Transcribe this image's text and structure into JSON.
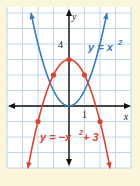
{
  "chart_data": {
    "type": "line",
    "title": "",
    "xlabel": "x",
    "ylabel": "y",
    "xlim": [
      -4,
      4
    ],
    "ylim": [
      -4,
      6.4
    ],
    "grid": true,
    "tick_labels": {
      "x": [
        "1"
      ],
      "y": [
        "4"
      ]
    },
    "series": [
      {
        "name": "y = x^2",
        "label": "y = x",
        "label_exp": "2",
        "color": "#3A7BB8",
        "x": [
          -2.45,
          -2,
          -1,
          0,
          1,
          2,
          2.45
        ],
        "y": [
          6.0,
          4,
          1,
          0,
          1,
          4,
          6.0
        ],
        "marked_points": []
      },
      {
        "name": "y = -x^2 + 3",
        "label": "y = −x",
        "label_exp": "2",
        "label_tail": " + 3",
        "color": "#D9442E",
        "x": [
          -2.65,
          -2,
          -1,
          0,
          1,
          2,
          2.65
        ],
        "y": [
          -4.0,
          -1,
          2,
          3,
          2,
          -1,
          -4.0
        ],
        "marked_points": [
          [
            -2,
            -1
          ],
          [
            -1,
            2
          ],
          [
            0,
            3
          ],
          [
            1,
            2
          ],
          [
            2,
            -1
          ]
        ]
      }
    ]
  },
  "colors": {
    "background": "#FBF5DC",
    "panel": "#FFFFFF",
    "grid": "#B9D3E6",
    "axis": "#111111"
  }
}
